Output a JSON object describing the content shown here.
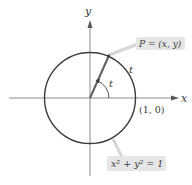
{
  "diagram": {
    "type": "unit-circle",
    "axes": {
      "x_label": "x",
      "y_label": "y"
    },
    "point": {
      "label": "P = (x, y)"
    },
    "arc_label": "t",
    "angle_label": "t",
    "intercept_label": "(1, 0)",
    "equation_label": "x² + y² = 1",
    "colors": {
      "circle": "#3c3c3c",
      "axis": "#8a8a8a",
      "radius": "#5a5a5a",
      "label_box": "#e6e6e6",
      "leader": "#d4d4d4",
      "text": "#3a3a3a"
    }
  }
}
